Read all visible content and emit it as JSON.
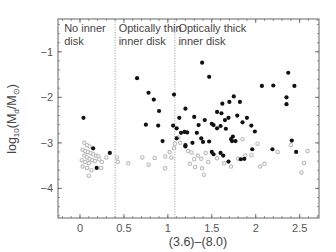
{
  "chart_data": {
    "type": "scatter",
    "title": "",
    "xlabel": "(3.6)–(8.0)",
    "ylabel": "log10(Md/M⊙)",
    "ylabel_parts": {
      "prefix": "log",
      "sub10": "10",
      "open": "(M",
      "subd": "d",
      "slash": "/M",
      "subsun": "⊙",
      "close": ")"
    },
    "xlim": [
      -0.25,
      2.72
    ],
    "ylim": [
      -4.65,
      -0.28
    ],
    "x_ticks": [
      0,
      0.5,
      1,
      1.5,
      2,
      2.5
    ],
    "x_tick_labels": [
      "0",
      "0.5",
      "1",
      "1.5",
      "2",
      "2.5"
    ],
    "y_ticks": [
      -1,
      -2,
      -3,
      -4
    ],
    "y_tick_labels": [
      "−1",
      "−2",
      "−3",
      "−4"
    ],
    "grid": false,
    "legend": null,
    "dividers": [
      {
        "x": 0.4,
        "style": "dotted"
      },
      {
        "x": 1.08,
        "style": "dotted"
      }
    ],
    "regions": [
      {
        "lines": [
          "No inner",
          "disk"
        ],
        "x": -0.18
      },
      {
        "lines": [
          "Optically thin",
          "inner disk"
        ],
        "x": 0.44
      },
      {
        "lines": [
          "Optically thick",
          "inner disk"
        ],
        "x": 1.12
      }
    ],
    "colors": {
      "detections": "#111111",
      "upper_limits": "#bbbbbb",
      "frame": "#666666",
      "dividers": "#888888"
    },
    "series": [
      {
        "name": "detections",
        "marker": "filled-circle",
        "points": [
          [
            0.04,
            -2.45
          ],
          [
            0.15,
            -3.12
          ],
          [
            0.34,
            -3.22
          ],
          [
            0.19,
            -3.55
          ],
          [
            0.65,
            -1.58
          ],
          [
            0.78,
            -1.9
          ],
          [
            0.84,
            -2.05
          ],
          [
            0.9,
            -2.3
          ],
          [
            0.75,
            -2.6
          ],
          [
            0.89,
            -2.62
          ],
          [
            1.07,
            -1.94
          ],
          [
            1.06,
            -2.62
          ],
          [
            1.1,
            -2.68
          ],
          [
            0.94,
            -2.96
          ],
          [
            1.15,
            -2.78
          ],
          [
            1.19,
            -2.76
          ],
          [
            1.39,
            -1.24
          ],
          [
            1.47,
            -1.55
          ],
          [
            1.13,
            -2.45
          ],
          [
            1.2,
            -2.25
          ],
          [
            1.3,
            -2.43
          ],
          [
            1.22,
            -2.77
          ],
          [
            1.35,
            -2.61
          ],
          [
            1.33,
            -2.78
          ],
          [
            1.42,
            -2.5
          ],
          [
            1.38,
            -2.9
          ],
          [
            1.52,
            -2.61
          ],
          [
            1.47,
            -2.97
          ],
          [
            1.5,
            -2.58
          ],
          [
            1.56,
            -2.68
          ],
          [
            1.6,
            -2.63
          ],
          [
            1.65,
            -2.5
          ],
          [
            1.66,
            -2.69
          ],
          [
            1.72,
            -2.92
          ],
          [
            1.73,
            -2.96
          ],
          [
            1.74,
            -2.86
          ],
          [
            1.56,
            -2.32
          ],
          [
            1.61,
            -2.35
          ],
          [
            1.69,
            -2.45
          ],
          [
            1.62,
            -2.14
          ],
          [
            1.7,
            -2.1
          ],
          [
            1.75,
            -1.98
          ],
          [
            1.79,
            -2.4
          ],
          [
            1.82,
            -2.1
          ],
          [
            1.85,
            -2.55
          ],
          [
            1.9,
            -2.45
          ],
          [
            1.95,
            -2.62
          ],
          [
            1.99,
            -2.75
          ],
          [
            2.07,
            -1.75
          ],
          [
            2.2,
            -1.74
          ],
          [
            2.37,
            -1.46
          ],
          [
            2.44,
            -1.75
          ],
          [
            2.35,
            -2.0
          ],
          [
            2.35,
            -2.15
          ],
          [
            2.41,
            -2.95
          ],
          [
            1.4,
            -2.98
          ],
          [
            1.28,
            -3.0
          ],
          [
            1.2,
            -3.05
          ],
          [
            1.1,
            -2.9
          ],
          [
            1.5,
            -3.2
          ],
          [
            1.52,
            -3.25
          ],
          [
            1.6,
            -3.22
          ],
          [
            1.63,
            -3.28
          ],
          [
            1.69,
            -3.41
          ],
          [
            1.83,
            -3.36
          ],
          [
            1.87,
            -3.35
          ],
          [
            1.96,
            -3.14
          ],
          [
            2.19,
            -3.14
          ],
          [
            2.46,
            -3.2
          ],
          [
            1.77,
            -2.96
          ],
          [
            1.2,
            -3.08
          ]
        ]
      },
      {
        "name": "upper_limits",
        "marker": "open-circle-gray",
        "points": [
          [
            0.05,
            -3.0
          ],
          [
            0.08,
            -3.05
          ],
          [
            0.11,
            -3.08
          ],
          [
            0.03,
            -3.15
          ],
          [
            0.06,
            -3.18
          ],
          [
            0.09,
            -3.2
          ],
          [
            0.12,
            -3.22
          ],
          [
            0.15,
            -3.25
          ],
          [
            0.18,
            -3.28
          ],
          [
            0.21,
            -3.3
          ],
          [
            0.05,
            -3.28
          ],
          [
            0.08,
            -3.32
          ],
          [
            0.11,
            -3.35
          ],
          [
            0.14,
            -3.38
          ],
          [
            0.02,
            -3.38
          ],
          [
            0.06,
            -3.42
          ],
          [
            0.1,
            -3.45
          ],
          [
            0.17,
            -3.4
          ],
          [
            0.22,
            -3.36
          ],
          [
            0.25,
            -3.42
          ],
          [
            0.03,
            -3.52
          ],
          [
            0.08,
            -3.55
          ],
          [
            0.13,
            -3.6
          ],
          [
            0.24,
            -3.55
          ],
          [
            0.1,
            -3.72
          ],
          [
            0.3,
            -3.32
          ],
          [
            0.42,
            -3.32
          ],
          [
            0.43,
            -3.42
          ],
          [
            0.55,
            -3.45
          ],
          [
            0.71,
            -3.32
          ],
          [
            0.78,
            -3.48
          ],
          [
            0.85,
            -3.33
          ],
          [
            0.97,
            -3.3
          ],
          [
            1.02,
            -3.2
          ],
          [
            1.04,
            -3.32
          ],
          [
            1.07,
            -3.12
          ],
          [
            1.08,
            -3.02
          ],
          [
            1.12,
            -2.88
          ],
          [
            1.23,
            -3.18
          ],
          [
            1.27,
            -3.21
          ],
          [
            1.3,
            -3.36
          ],
          [
            1.34,
            -3.28
          ],
          [
            1.38,
            -3.35
          ],
          [
            1.43,
            -3.22
          ],
          [
            1.25,
            -3.46
          ],
          [
            1.31,
            -3.53
          ],
          [
            1.39,
            -3.56
          ],
          [
            1.41,
            -3.7
          ],
          [
            1.46,
            -3.42
          ],
          [
            1.56,
            -3.34
          ],
          [
            1.64,
            -3.45
          ],
          [
            1.72,
            -3.52
          ],
          [
            1.8,
            -3.35
          ],
          [
            1.88,
            -3.28
          ],
          [
            1.95,
            -3.27
          ],
          [
            2.05,
            -3.52
          ],
          [
            2.1,
            -3.46
          ],
          [
            2.25,
            -3.2
          ],
          [
            2.59,
            -3.18
          ],
          [
            2.55,
            -3.44
          ],
          [
            2.52,
            -3.65
          ],
          [
            2.02,
            -3.02
          ],
          [
            1.85,
            -2.92
          ],
          [
            2.4,
            -3.05
          ],
          [
            1.14,
            -3.0
          ],
          [
            0.97,
            -3.56
          ]
        ]
      }
    ]
  }
}
